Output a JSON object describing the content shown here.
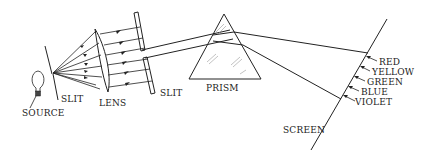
{
  "diagram": {
    "labels": {
      "source": "SOURCE",
      "slit1": "SLIT",
      "lens": "LENS",
      "slit2": "SLIT",
      "prism": "PRISM",
      "screen": "SCREEN"
    },
    "spectrum": [
      {
        "name": "RED"
      },
      {
        "name": "YELLOW"
      },
      {
        "name": "GREEN"
      },
      {
        "name": "BLUE"
      },
      {
        "name": "VIOLET"
      }
    ],
    "colors": {
      "line": "#222222",
      "background": "#ffffff"
    }
  }
}
